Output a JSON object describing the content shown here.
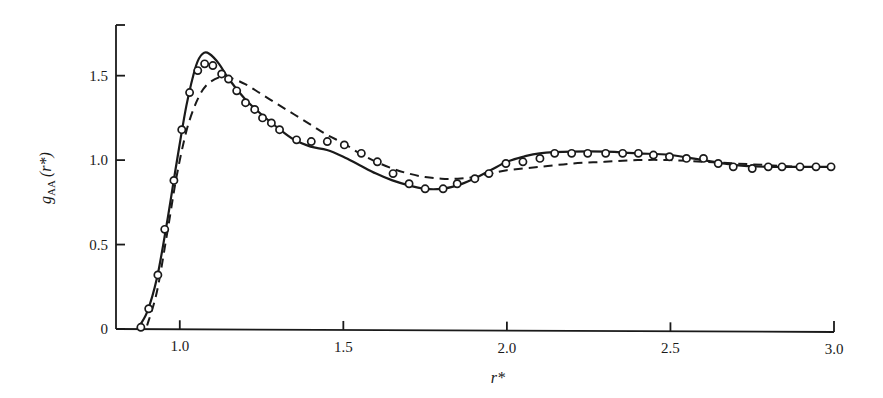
{
  "chart_data": {
    "type": "line",
    "title": "",
    "xlabel": "r*",
    "ylabel": "g_AA (r*)",
    "ylabel_parts": {
      "main": "g",
      "sub": "AA",
      "arg": "(r*)"
    },
    "xlim": [
      0.805,
      3.0
    ],
    "ylim": [
      0,
      1.8
    ],
    "grid": false,
    "legend": "none",
    "x_ticks": [
      1.0,
      1.5,
      2.0,
      2.5,
      3.0
    ],
    "x_tick_labels": [
      "1.0",
      "1.5",
      "2.0",
      "2.5",
      "3.0"
    ],
    "y_ticks": [
      0,
      0.5,
      1.0,
      1.5
    ],
    "y_tick_labels": [
      "0",
      "0.5",
      "1.0",
      "1.5"
    ],
    "series": [
      {
        "name": "solid-curve",
        "style": "solid",
        "x": [
          0.87,
          0.9,
          0.93,
          0.96,
          0.99,
          1.02,
          1.05,
          1.07,
          1.09,
          1.12,
          1.15,
          1.2,
          1.25,
          1.3,
          1.35,
          1.4,
          1.45,
          1.5,
          1.55,
          1.6,
          1.65,
          1.7,
          1.75,
          1.8,
          1.85,
          1.9,
          1.95,
          2.0,
          2.05,
          2.1,
          2.2,
          2.3,
          2.4,
          2.5,
          2.6,
          2.7,
          2.8,
          2.9,
          3.0
        ],
        "y": [
          0.0,
          0.1,
          0.3,
          0.62,
          0.98,
          1.32,
          1.56,
          1.63,
          1.63,
          1.57,
          1.48,
          1.36,
          1.27,
          1.19,
          1.12,
          1.08,
          1.06,
          1.02,
          0.97,
          0.92,
          0.88,
          0.85,
          0.83,
          0.83,
          0.85,
          0.89,
          0.94,
          0.99,
          1.02,
          1.04,
          1.05,
          1.05,
          1.04,
          1.03,
          1.0,
          0.97,
          0.96,
          0.96,
          0.96
        ]
      },
      {
        "name": "dashed-curve",
        "style": "dashed",
        "x": [
          0.9,
          0.93,
          0.96,
          0.99,
          1.02,
          1.05,
          1.08,
          1.12,
          1.15,
          1.2,
          1.25,
          1.3,
          1.35,
          1.4,
          1.45,
          1.5,
          1.55,
          1.6,
          1.65,
          1.7,
          1.75,
          1.8,
          1.85,
          1.9,
          1.95,
          2.0,
          2.1,
          2.2,
          2.3,
          2.4,
          2.5,
          2.6,
          2.7,
          2.8,
          2.9,
          3.0
        ],
        "y": [
          0.02,
          0.22,
          0.55,
          0.9,
          1.17,
          1.34,
          1.44,
          1.49,
          1.49,
          1.45,
          1.39,
          1.33,
          1.27,
          1.21,
          1.15,
          1.1,
          1.04,
          0.99,
          0.95,
          0.92,
          0.9,
          0.89,
          0.89,
          0.9,
          0.92,
          0.94,
          0.96,
          0.98,
          0.99,
          1.0,
          1.0,
          0.99,
          0.98,
          0.97,
          0.96,
          0.96
        ]
      },
      {
        "name": "open-circles",
        "style": "markers",
        "x": [
          0.881,
          0.905,
          0.933,
          0.954,
          0.982,
          1.006,
          1.03,
          1.055,
          1.076,
          1.101,
          1.128,
          1.149,
          1.174,
          1.201,
          1.229,
          1.253,
          1.28,
          1.305,
          1.357,
          1.402,
          1.451,
          1.503,
          1.555,
          1.604,
          1.652,
          1.701,
          1.75,
          1.805,
          1.848,
          1.902,
          1.945,
          1.997,
          2.049,
          2.101,
          2.146,
          2.198,
          2.247,
          2.302,
          2.354,
          2.402,
          2.448,
          2.497,
          2.549,
          2.601,
          2.646,
          2.692,
          2.75,
          2.799,
          2.841,
          2.896,
          2.945,
          2.991
        ],
        "y": [
          0.01,
          0.12,
          0.32,
          0.59,
          0.88,
          1.18,
          1.4,
          1.53,
          1.57,
          1.56,
          1.51,
          1.48,
          1.41,
          1.34,
          1.3,
          1.25,
          1.22,
          1.18,
          1.12,
          1.11,
          1.11,
          1.09,
          1.04,
          0.99,
          0.92,
          0.86,
          0.83,
          0.83,
          0.86,
          0.89,
          0.92,
          0.98,
          0.99,
          1.01,
          1.04,
          1.04,
          1.04,
          1.04,
          1.04,
          1.04,
          1.03,
          1.02,
          1.01,
          1.01,
          0.98,
          0.96,
          0.95,
          0.96,
          0.96,
          0.96,
          0.96,
          0.96
        ]
      }
    ]
  },
  "style": {
    "ink": "#1a1a1a",
    "background": "#ffffff"
  }
}
